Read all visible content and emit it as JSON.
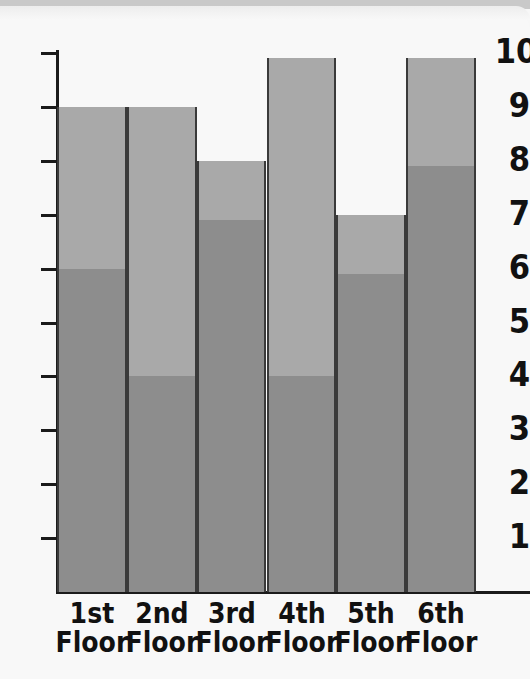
{
  "chart_data": {
    "type": "bar",
    "title": "",
    "subtitle": "",
    "xlabel": "",
    "ylabel": "",
    "ylim": [
      0,
      10
    ],
    "yticks": [
      1,
      2,
      3,
      4,
      5,
      6,
      7,
      8,
      9,
      10
    ],
    "ytick_labels": [
      "1",
      "2",
      "3",
      "4",
      "5",
      "6",
      "7",
      "8",
      "9",
      "10"
    ],
    "grid": false,
    "legend": "none",
    "stacked": true,
    "categories": [
      "1st Floor",
      "2nd Floor",
      "3rd Floor",
      "4th Floor",
      "5th Floor",
      "6th Floor"
    ],
    "category_lines": [
      [
        "1st",
        "Floor"
      ],
      [
        "2nd",
        "Floor"
      ],
      [
        "3rd",
        "Floor"
      ],
      [
        "4th",
        "Floor"
      ],
      [
        "5th",
        "Floor"
      ],
      [
        "6th",
        "Floor"
      ]
    ],
    "series": [
      {
        "name": "lower-segment",
        "color": "#8d8d8d",
        "values": [
          6,
          4,
          6.9,
          4,
          5.9,
          7.9
        ]
      },
      {
        "name": "upper-segment",
        "color": "#a9a9a9",
        "values": [
          3,
          5,
          1.1,
          5.9,
          1.1,
          2.0
        ]
      }
    ],
    "totals": [
      9,
      9,
      8,
      9.9,
      7,
      9.9
    ],
    "bar_colors": {
      "upper": "#a9a9a9",
      "lower": "#8d8d8d",
      "outline": "#3a3a3a"
    },
    "axis_color": "#1b1b1b",
    "background": "#f8f8f8"
  }
}
